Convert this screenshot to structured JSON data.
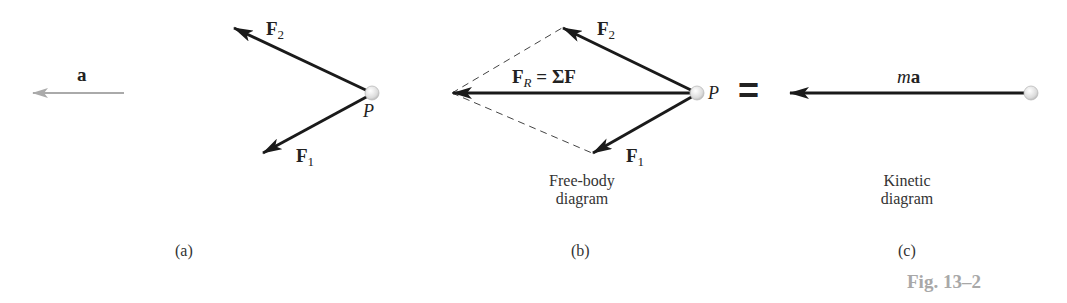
{
  "figure": {
    "number_label": "Fig. 13–2",
    "colors": {
      "force_vector": "#1a1a1a",
      "acceleration_vector": "#aaaaaa",
      "construction_line": "#444444",
      "particle_fill": "#e6e6e6",
      "caption_gray": "#a8a8a8"
    }
  },
  "panel_a": {
    "part_label": "(a)",
    "acceleration": {
      "symbol": "a"
    },
    "force_2": {
      "symbol": "F",
      "subscript": "2"
    },
    "force_1": {
      "symbol": "F",
      "subscript": "1"
    },
    "point": {
      "label": "P"
    }
  },
  "panel_b": {
    "part_label": "(b)",
    "caption_line1": "Free-body",
    "caption_line2": "diagram",
    "force_2": {
      "symbol": "F",
      "subscript": "2"
    },
    "force_1": {
      "symbol": "F",
      "subscript": "1"
    },
    "resultant": {
      "symbol": "F",
      "subscript": "R",
      "equals": "= ΣF"
    },
    "point": {
      "label": "P"
    }
  },
  "equals_sign": "=",
  "panel_c": {
    "part_label": "(c)",
    "caption_line1": "Kinetic",
    "caption_line2": "diagram",
    "vector": {
      "mass_symbol": "m",
      "accel_symbol": "a"
    }
  }
}
